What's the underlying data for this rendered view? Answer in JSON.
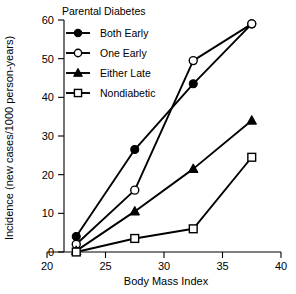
{
  "chart_data": {
    "type": "line",
    "title": "",
    "xlabel": "Body Mass Index",
    "ylabel": "Incidence (new cases/1000 person-years)",
    "xlim": [
      20,
      40
    ],
    "ylim": [
      0,
      60
    ],
    "xticks": [
      20,
      25,
      30,
      35,
      40
    ],
    "yticks": [
      0,
      10,
      20,
      30,
      40,
      50,
      60
    ],
    "xtick_labels": [
      "20",
      "25",
      "30",
      "35",
      "40"
    ],
    "ytick_labels": [
      "0",
      "10",
      "20",
      "30",
      "40",
      "50",
      "60"
    ],
    "grid": false,
    "legend_position": "upper-left-inside",
    "legend_title": "Parental Diabetes",
    "x": [
      22.5,
      27.5,
      32.5,
      37.5
    ],
    "series": [
      {
        "name": "Both Early",
        "marker": "filled-circle",
        "color": "#000000",
        "values": [
          4.0,
          26.5,
          43.5,
          59.0
        ]
      },
      {
        "name": "One Early",
        "marker": "open-circle",
        "color": "#000000",
        "values": [
          2.0,
          16.0,
          49.5,
          59.0
        ]
      },
      {
        "name": "Either Late",
        "marker": "filled-triangle",
        "color": "#000000",
        "values": [
          0.3,
          10.5,
          21.5,
          34.0
        ]
      },
      {
        "name": "Nondiabetic",
        "marker": "open-square",
        "color": "#000000",
        "values": [
          0.0,
          3.5,
          6.0,
          24.5
        ]
      }
    ]
  },
  "legend": {
    "title": "Parental Diabetes",
    "items": [
      {
        "label": "Both Early"
      },
      {
        "label": "One Early"
      },
      {
        "label": "Either Late"
      },
      {
        "label": "Nondiabetic"
      }
    ]
  },
  "axes": {
    "x_title": "Body Mass Index",
    "y_title": "Incidence (new cases/1000 person-years)"
  }
}
